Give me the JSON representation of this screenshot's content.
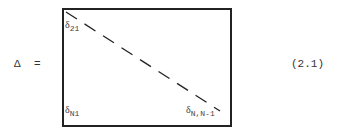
{
  "equation": {
    "lhs_symbol": "Δ",
    "equals": "=",
    "number": "(2.1)",
    "matrix": {
      "top_left": {
        "base": "δ",
        "sub": "21"
      },
      "bottom_left": {
        "base": "δ",
        "sub": "N1"
      },
      "bottom_right": {
        "base": "δ",
        "sub": "N,N-1"
      },
      "diagonal_style": "dashed"
    }
  }
}
